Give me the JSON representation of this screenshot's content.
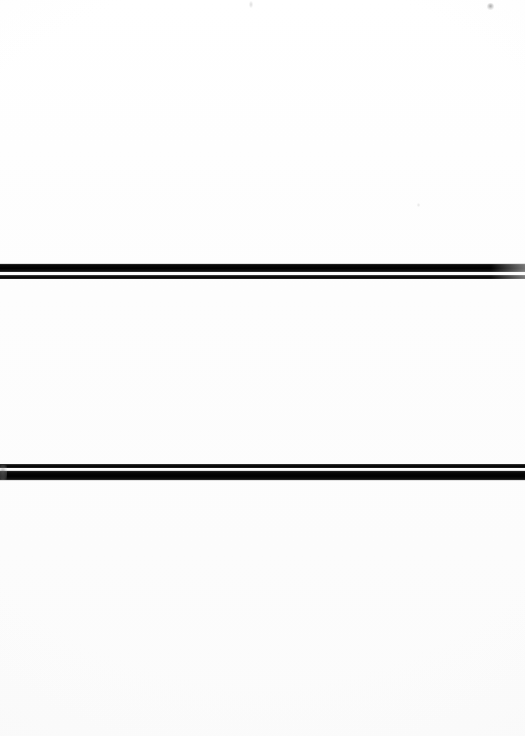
{
  "page": {
    "kind": "scanned-document-page",
    "width_px": 525,
    "height_px": 736,
    "background_color": "#fdfdfd",
    "text_content": ""
  },
  "marks": {
    "band_color": "#000000",
    "band_highlight_color": "#3a3a3a",
    "gap_color": "#fdfdfd",
    "items": [
      {
        "name": "upper-rule-band",
        "top_px": 264,
        "height_px": 17,
        "left_px": 0,
        "width_px": 525,
        "order": "thick-then-thin",
        "thick_height_px": 8,
        "gap_height_px": 3,
        "thin_height_px": 4,
        "spans_full_width": true
      },
      {
        "name": "lower-rule-band",
        "top_px": 464,
        "height_px": 17,
        "left_px": 0,
        "width_px": 525,
        "order": "thin-then-thick",
        "thin_height_px": 4,
        "gap_height_px": 3,
        "thick_height_px": 9,
        "spans_full_width": true
      }
    ]
  },
  "artifacts": {
    "specks": [
      {
        "name": "top-edge-speck-left",
        "x_px": 249,
        "y_px": 1,
        "color": "#d6d6d6"
      },
      {
        "name": "top-edge-speck-right",
        "x_px": 487,
        "y_px": 3,
        "color": "#969696"
      },
      {
        "name": "mid-page-speck",
        "x_px": 417,
        "y_px": 203,
        "color": "#e2e2e2"
      }
    ],
    "blob": {
      "name": "lower-band-left-blob",
      "x_px": 0,
      "y_px": 465,
      "color": "#787878"
    }
  }
}
